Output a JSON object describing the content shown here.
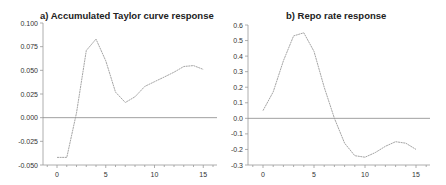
{
  "chart_data": [
    {
      "type": "line",
      "title": "a) Accumulated Taylor curve  response",
      "xlabel": "",
      "ylabel": "",
      "x": [
        0,
        1,
        2,
        3,
        4,
        5,
        6,
        7,
        8,
        9,
        10,
        11,
        12,
        13,
        14,
        15
      ],
      "series": [
        {
          "name": "Accumulated Taylor curve response",
          "values": [
            -0.042,
            -0.042,
            0.005,
            0.071,
            0.083,
            0.06,
            0.027,
            0.016,
            0.022,
            0.033,
            0.038,
            0.043,
            0.048,
            0.054,
            0.055,
            0.051
          ]
        }
      ],
      "xticks": [
        "0",
        "5",
        "10",
        "15"
      ],
      "yticks": [
        "0.100",
        "0.075",
        "0.050",
        "0.025",
        "0.000",
        "-0.025",
        "-0.050"
      ],
      "xlim": [
        -1,
        16
      ],
      "ylim": [
        -0.05,
        0.1
      ],
      "zero_line": true,
      "grid": false
    },
    {
      "type": "line",
      "title": "b) Repo rate response",
      "xlabel": "",
      "ylabel": "",
      "x": [
        0,
        1,
        2,
        3,
        4,
        5,
        6,
        7,
        8,
        9,
        10,
        11,
        12,
        13,
        14,
        15
      ],
      "series": [
        {
          "name": "Repo rate response",
          "values": [
            0.05,
            0.17,
            0.37,
            0.53,
            0.55,
            0.43,
            0.2,
            0.0,
            -0.16,
            -0.24,
            -0.25,
            -0.22,
            -0.18,
            -0.15,
            -0.16,
            -0.2
          ]
        }
      ],
      "xticks": [
        "0",
        "5",
        "10",
        "15"
      ],
      "yticks": [
        "0.6",
        "0.5",
        "0.4",
        "0.3",
        "0.2",
        "0.1",
        "0.0",
        "-0.1",
        "-0.2",
        "-0.3"
      ],
      "xlim": [
        -1,
        16
      ],
      "ylim": [
        -0.3,
        0.6
      ],
      "zero_line": true,
      "grid": false
    }
  ],
  "style": {
    "line_color": "#9a9a9a",
    "axis_color": "#999999",
    "text_color": "#222222"
  }
}
